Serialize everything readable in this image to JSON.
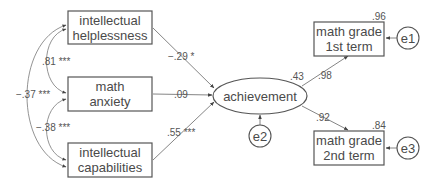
{
  "diagram": {
    "type": "structural-equation-model",
    "predictors": [
      {
        "id": "helplessness",
        "line1": "intellectual",
        "line2": "helplessness",
        "path_coef": "−.29 *"
      },
      {
        "id": "anxiety",
        "line1": "math",
        "line2": "anxiety",
        "path_coef": ".09"
      },
      {
        "id": "capabilities",
        "line1": "intellectual",
        "line2": "capabilities",
        "path_coef": ".55 ***"
      }
    ],
    "covariances": [
      {
        "between": [
          "helplessness",
          "anxiety"
        ],
        "value": ".81 ***"
      },
      {
        "between": [
          "anxiety",
          "capabilities"
        ],
        "value": "−.38 ***"
      },
      {
        "between": [
          "helplessness",
          "capabilities"
        ],
        "value": "−.37 ***"
      }
    ],
    "latent": {
      "label": "achievement",
      "r2": ".43",
      "error": "e2"
    },
    "outcomes": [
      {
        "id": "grade1",
        "line1": "math grade",
        "line2": "1st term",
        "loading": ".98",
        "r2": ".96",
        "error": "e1"
      },
      {
        "id": "grade2",
        "line1": "math grade",
        "line2": "2nd term",
        "loading": ".92",
        "r2": ".84",
        "error": "e3"
      }
    ]
  }
}
